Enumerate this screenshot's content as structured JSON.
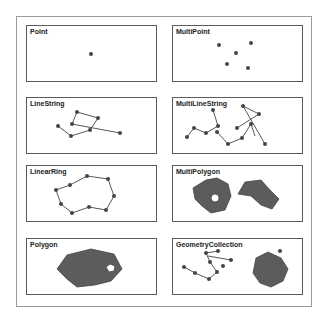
{
  "panels": [
    {
      "id": "point",
      "title": "Point",
      "x": 26,
      "y": 25
    },
    {
      "id": "multipoint",
      "title": "MultiPoint",
      "x": 172,
      "y": 25
    },
    {
      "id": "linestring",
      "title": "LineString",
      "x": 26,
      "y": 97
    },
    {
      "id": "multilinestring",
      "title": "MultiLineString",
      "x": 172,
      "y": 97
    },
    {
      "id": "linearring",
      "title": "LinearRing",
      "x": 26,
      "y": 165
    },
    {
      "id": "multipolygon",
      "title": "MultiPolygon",
      "x": 172,
      "y": 165
    },
    {
      "id": "polygon",
      "title": "Polygon",
      "x": 26,
      "y": 238
    },
    {
      "id": "geometrycollection",
      "title": "GeometryCollection",
      "x": 172,
      "y": 238
    }
  ],
  "colors": {
    "fill": "#5c5c5c",
    "stroke": "#444444",
    "point": "#444444",
    "border": "#5a5a5a"
  }
}
